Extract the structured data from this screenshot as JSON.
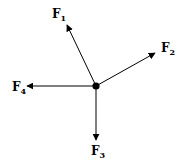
{
  "diagram": {
    "type": "free-body-force-diagram",
    "colors": {
      "stroke": "#000000",
      "background": "#ffffff"
    },
    "center": {
      "x": 96,
      "y": 86,
      "r": 3.6
    },
    "forces": [
      {
        "name": "F",
        "sub": "1",
        "tip": [
          67,
          25
        ],
        "label_pos": [
          52,
          18
        ]
      },
      {
        "name": "F",
        "sub": "2",
        "tip": [
          155,
          53
        ],
        "label_pos": [
          161,
          52
        ]
      },
      {
        "name": "F",
        "sub": "3",
        "tip": [
          96,
          140
        ],
        "label_pos": [
          91,
          155
        ]
      },
      {
        "name": "F",
        "sub": "4",
        "tip": [
          27,
          86
        ],
        "label_pos": [
          12,
          91
        ]
      }
    ]
  }
}
